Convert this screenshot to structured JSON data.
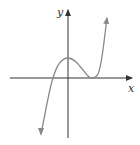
{
  "figure": {
    "x_axis_label": "x",
    "y_axis_label": "y",
    "colors": {
      "axes": "#333333",
      "curve": "#888888"
    }
  }
}
